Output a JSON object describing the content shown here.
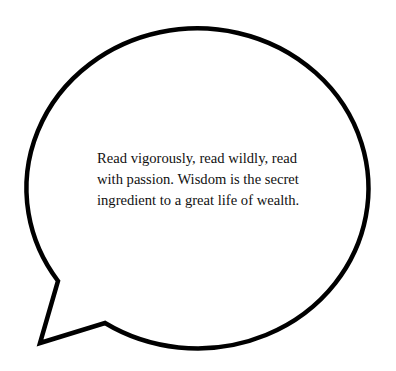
{
  "bubble": {
    "type": "speech-bubble",
    "stroke_color": "#000000",
    "fill_color": "#ffffff"
  },
  "quote": {
    "lines": [
      "Read vigorously, read wildly, read",
      "with passion. Wisdom is the secret",
      "ingredient to a great life of wealth."
    ],
    "full_text": "Read vigorously, read wildly, read with passion. Wisdom is the secret ingredient to a great life of wealth."
  }
}
